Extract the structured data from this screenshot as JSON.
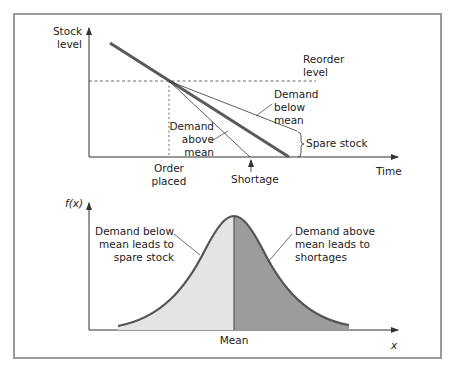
{
  "top_diagram": {
    "y_axis_label_line1": "Stock",
    "y_axis_label_line2": "level",
    "x_axis_label": "Time",
    "reorder_label_line1": "Reorder",
    "reorder_label_line2": "level",
    "below_mean_line1": "Demand",
    "below_mean_line2": "below",
    "below_mean_line3": "mean",
    "above_mean_line1": "Demand",
    "above_mean_line2": "above",
    "above_mean_line3": "mean",
    "spare_stock_label": "Spare stock",
    "order_placed_line1": "Order",
    "order_placed_line2": "placed",
    "shortage_label": "Shortage"
  },
  "bottom_diagram": {
    "y_axis_label": "f(x)",
    "x_axis_label": "x",
    "mean_label": "Mean",
    "left_note_line1": "Demand below",
    "left_note_line2": "mean leads to",
    "left_note_line3": "spare stock",
    "right_note_line1": "Demand above",
    "right_note_line2": "mean leads to",
    "right_note_line3": "shortages"
  },
  "colors": {
    "frame": "#9a9a9a",
    "axis": "#333333",
    "thick_line": "#5a5a5a",
    "light_fill": "#e4e4e4",
    "dark_fill": "#9c9c9c",
    "curve_stroke": "#555555"
  }
}
